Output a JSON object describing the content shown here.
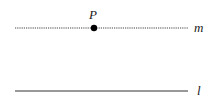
{
  "diagram": {
    "point": {
      "label": "P",
      "x": 94,
      "y": 28
    },
    "line_m": {
      "label": "m",
      "style": "dotted",
      "y": 28,
      "x1": 15,
      "x2": 188
    },
    "line_l": {
      "label": "l",
      "style": "solid",
      "y": 91,
      "x1": 15,
      "x2": 188
    },
    "colors": {
      "line": "#333333",
      "point": "#000000",
      "text": "#1a1a1a"
    }
  }
}
